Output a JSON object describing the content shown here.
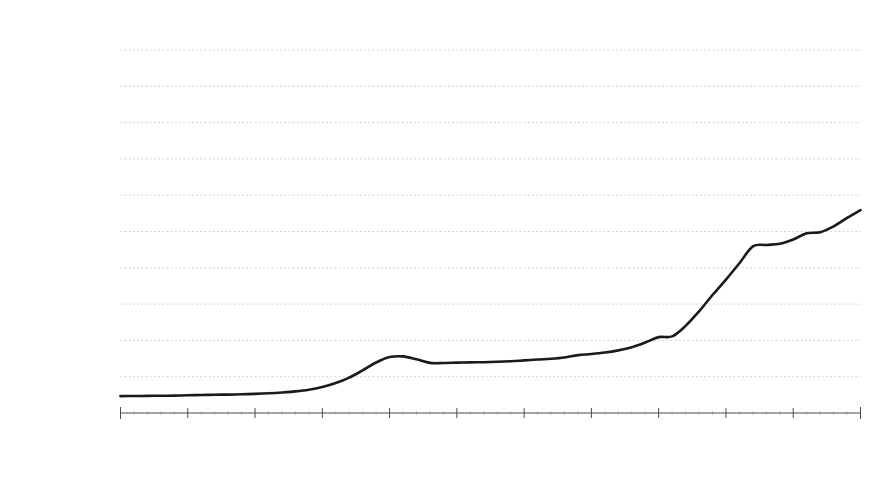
{
  "chart_data": {
    "type": "line",
    "title": "",
    "subtitle": "",
    "xlabel": "",
    "ylabel": "M4，百萬英鎊",
    "ylabel_chars": [
      "M",
      "4",
      "，",
      "百",
      "萬",
      "英",
      "鎊"
    ],
    "xlim": [
      1900,
      1955
    ],
    "ylim": [
      0,
      20000
    ],
    "grid": true,
    "grid_axis": "y",
    "legend": false,
    "legend_position": "none",
    "x_tick_labels": [
      "1900",
      "1905",
      "1910",
      "1915",
      "1920",
      "1925",
      "1930",
      "1935",
      "1940",
      "1945",
      "1950",
      "1955"
    ],
    "x_tick_values": [
      1900,
      1905,
      1910,
      1915,
      1920,
      1925,
      1930,
      1935,
      1940,
      1945,
      1950,
      1955
    ],
    "x_minor_tick_step": 1,
    "y_tick_labels": [
      "£0",
      "£2,000",
      "£4,000",
      "£6,000",
      "£8,000",
      "£10,000",
      "£12,000",
      "£14,000",
      "£16,000",
      "£18,000",
      "£20,000"
    ],
    "y_tick_values": [
      0,
      2000,
      4000,
      6000,
      8000,
      10000,
      12000,
      14000,
      16000,
      18000,
      20000
    ],
    "currency_symbol": "£",
    "series": [
      {
        "name": "M4",
        "color": "#1a1a1a",
        "x": [
          1900,
          1901,
          1902,
          1903,
          1904,
          1905,
          1906,
          1907,
          1908,
          1909,
          1910,
          1911,
          1912,
          1913,
          1914,
          1915,
          1916,
          1917,
          1918,
          1919,
          1920,
          1921,
          1922,
          1923,
          1924,
          1925,
          1926,
          1927,
          1928,
          1929,
          1930,
          1931,
          1932,
          1933,
          1934,
          1935,
          1936,
          1937,
          1938,
          1939,
          1940,
          1941,
          1942,
          1943,
          1944,
          1945,
          1946,
          1947,
          1948,
          1949,
          1950,
          1951,
          1952,
          1953,
          1954,
          1955
        ],
        "values": [
          930,
          935,
          945,
          950,
          960,
          975,
          990,
          1005,
          1015,
          1030,
          1055,
          1085,
          1130,
          1190,
          1280,
          1430,
          1650,
          1950,
          2350,
          2780,
          3080,
          3120,
          2960,
          2760,
          2755,
          2775,
          2790,
          2800,
          2820,
          2850,
          2900,
          2950,
          2990,
          3060,
          3190,
          3250,
          3330,
          3450,
          3620,
          3880,
          4180,
          4220,
          4800,
          5600,
          6500,
          7350,
          8250,
          9180,
          9260,
          9320,
          9560,
          9900,
          9960,
          10280,
          10750,
          11180
        ]
      }
    ]
  },
  "axes": {
    "y_axis_label_text": "M4，百萬英鎊"
  }
}
